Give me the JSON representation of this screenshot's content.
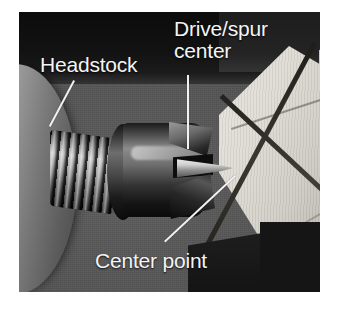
{
  "figure": {
    "kind": "annotated-photograph",
    "width": 340,
    "height": 314,
    "background_color": "#ffffff",
    "photo": {
      "left": 19,
      "top": 12,
      "width": 301,
      "height": 280,
      "backdrop_color": "#555555",
      "top_band_color": "#0d0d0d",
      "dark_corner_color": "#151515"
    }
  },
  "annotations": [
    {
      "id": "headstock",
      "label": "Headstock",
      "lines": [
        "Headstock"
      ],
      "text_color": "#f4f4f4",
      "leader": {
        "from_x": 73,
        "from_y": 81,
        "to_x": 48,
        "to_y": 125
      }
    },
    {
      "id": "drive-spur-center",
      "label": "Drive/spur center",
      "lines": [
        "Drive/spur",
        "center"
      ],
      "text_color": "#f4f4f4",
      "leader": {
        "from_x": 189,
        "from_y": 75,
        "to_x": 189,
        "to_y": 149
      }
    },
    {
      "id": "center-point",
      "label": "Center point",
      "lines": [
        "Center point"
      ],
      "text_color": "#f4f4f4",
      "leader": {
        "from_x": 164,
        "from_y": 241,
        "to_x": 235,
        "to_y": 175
      }
    }
  ],
  "objects": {
    "headstock": {
      "name": "Headstock",
      "color": "#9c9c9c"
    },
    "threaded_shaft": {
      "name": "Threaded shaft",
      "color": "#b4b4b4"
    },
    "drive_body": {
      "name": "Drive center body",
      "color": "#4f4f4f"
    },
    "spur_flutes": {
      "name": "Spur cutting flutes",
      "color": "#2a2a2a"
    },
    "center_point": {
      "name": "Center point spike",
      "color": "#e8e8e8"
    },
    "wood_block": {
      "name": "Square wood blank",
      "color": "#ded 0",
      "face_color": "#dedcd4",
      "kerf_color": "#2e2c28"
    }
  }
}
